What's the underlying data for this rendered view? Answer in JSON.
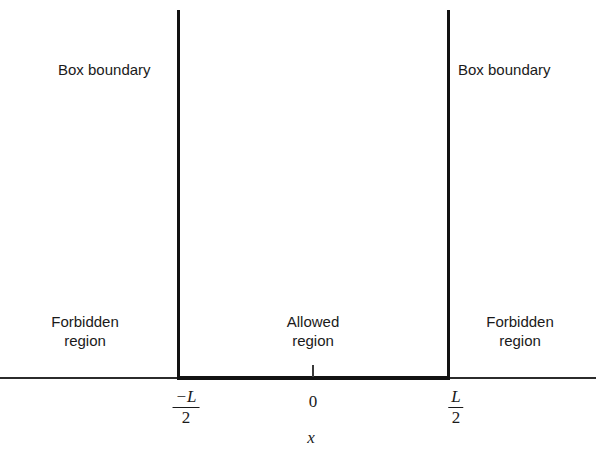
{
  "figure": {
    "type": "potential-well-diagram",
    "background_color": "#ffffff",
    "line_color": "#121212",
    "text_color": "#1a1a1a"
  },
  "labels": {
    "boundary_left": "Box boundary",
    "boundary_right": "Box boundary",
    "region_forbidden_left_line1": "Forbidden",
    "region_forbidden_left_line2": "region",
    "region_allowed_line1": "Allowed",
    "region_allowed_line2": "region",
    "region_forbidden_right_line1": "Forbidden",
    "region_forbidden_right_line2": "region"
  },
  "axis": {
    "name": "x",
    "ticks": [
      {
        "value": "-L/2",
        "numerator": "−L",
        "denominator": "2"
      },
      {
        "value": "0",
        "text": "0"
      },
      {
        "value": "L/2",
        "numerator": "L",
        "denominator": "2"
      }
    ],
    "tick_zero_label": "0",
    "tick_left_numerator": "−L",
    "tick_left_denominator": "2",
    "tick_right_numerator": "L",
    "tick_right_denominator": "2"
  },
  "chart_data": {
    "type": "line",
    "title": "",
    "xlabel": "x",
    "ylabel": "",
    "xlim": [
      -1.155,
      1.07
    ],
    "ylim": [
      0,
      1.0
    ],
    "grid": false,
    "legend": null,
    "series": [
      {
        "name": "Potential V(x)",
        "x": [
          -1.155,
          -0.5,
          -0.5,
          0.5,
          0.5,
          1.07
        ],
        "y": [
          0,
          0,
          1.0,
          1.0,
          0,
          0
        ]
      }
    ],
    "annotations": [
      {
        "text": "Box boundary",
        "x": -0.78,
        "y": 0.86
      },
      {
        "text": "Box boundary",
        "x": 0.22,
        "y": 0.86
      },
      {
        "text": "Forbidden region",
        "x": -0.845,
        "y": 0.175
      },
      {
        "text": "Allowed region",
        "x": 0.0,
        "y": 0.175
      },
      {
        "text": "Forbidden region",
        "x": 0.765,
        "y": 0.175
      }
    ],
    "xticks": [
      -0.5,
      0,
      0.5
    ],
    "xticklabels": [
      "−L/2",
      "0",
      "L/2"
    ]
  }
}
